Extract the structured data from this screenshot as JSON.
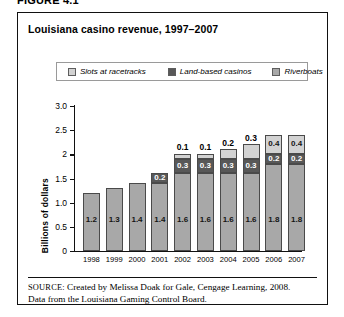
{
  "figure_caption": "FIGURE 4.1",
  "title": "Louisiana casino revenue, 1997–2007",
  "legend": {
    "items": [
      {
        "label": "Slots at racetracks",
        "color": "#d2d2d2"
      },
      {
        "label": "Land-based casinos",
        "color": "#585858"
      },
      {
        "label": "Riverboats",
        "color": "#a8a8a8"
      }
    ]
  },
  "source": {
    "prefix": "SOURCE:",
    "line1": " Created by Melissa Doak for Gale, Cengage Learning, 2008.",
    "line2": "Data from the Louisiana Gaming Control Board."
  },
  "chart_data": {
    "type": "bar",
    "stacked": true,
    "title": "Louisiana casino revenue, 1997–2007",
    "xlabel": "",
    "ylabel": "Billions of dollars",
    "ylim": [
      0,
      3.0
    ],
    "ytick_labels": [
      "0",
      "0.5",
      "1.0",
      "1.5",
      "2",
      "2.5",
      "3.0"
    ],
    "ytick_values": [
      0,
      0.5,
      1.0,
      1.5,
      2.0,
      2.5,
      3.0
    ],
    "grid": false,
    "legend_position": "top",
    "categories": [
      "1998",
      "1999",
      "2000",
      "2001",
      "2002",
      "2003",
      "2004",
      "2005",
      "2006",
      "2007"
    ],
    "series": [
      {
        "name": "Riverboats",
        "color": "#a8a8a8",
        "values": [
          1.2,
          1.3,
          1.4,
          1.4,
          1.6,
          1.6,
          1.6,
          1.6,
          1.8,
          1.8
        ],
        "labels": [
          "1.2",
          "1.3",
          "1.4",
          "1.4",
          "1.6",
          "1.6",
          "1.6",
          "1.6",
          "1.8",
          "1.8"
        ]
      },
      {
        "name": "Land-based casinos",
        "color": "#585858",
        "values": [
          0,
          0,
          0,
          0.2,
          0.3,
          0.3,
          0.3,
          0.3,
          0.2,
          0.2
        ],
        "labels": [
          "",
          "",
          "",
          "0.2",
          "0.3",
          "0.3",
          "0.3",
          "0.3",
          "0.2",
          "0.2"
        ]
      },
      {
        "name": "Slots at racetracks",
        "color": "#d2d2d2",
        "values": [
          0,
          0,
          0,
          0,
          0.1,
          0.1,
          0.2,
          0.3,
          0.4,
          0.4
        ],
        "labels": [
          "",
          "",
          "",
          "",
          "0.1",
          "0.1",
          "0.2",
          "0.3",
          "0.4",
          "0.4"
        ],
        "label_outside": [
          false,
          false,
          false,
          false,
          true,
          true,
          true,
          true,
          false,
          false
        ]
      }
    ],
    "totals": [
      1.2,
      1.3,
      1.4,
      1.6,
      2.0,
      2.0,
      2.1,
      2.2,
      2.4,
      2.4
    ]
  }
}
